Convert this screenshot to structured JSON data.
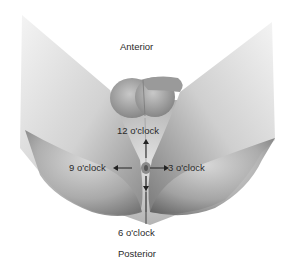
{
  "diagram": {
    "orientation_top": "Anterior",
    "orientation_bottom": "Posterior",
    "positions": {
      "top": "12 o'clock",
      "left": "9 o'clock",
      "right": "3 o'clock",
      "bottom": "6 o'clock"
    },
    "colors": {
      "text": "#2a2a2a",
      "skin_light": "#eeeeee",
      "skin_dark": "#6e6e6e",
      "background": "#ffffff"
    }
  }
}
